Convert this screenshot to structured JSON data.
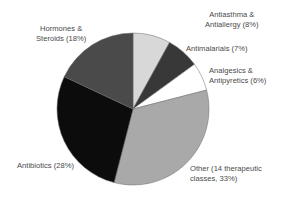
{
  "chart_data": {
    "type": "pie",
    "title": "",
    "start_angle": "12 o'clock",
    "direction": "clockwise",
    "slices": [
      {
        "name": "Antiasthma & Antiallergy",
        "value": 8,
        "color": "#d8d8d8"
      },
      {
        "name": "Antimalarials",
        "value": 7,
        "color": "#383838"
      },
      {
        "name": "Analgesics & Antipyretics",
        "value": 6,
        "color": "#ffffff"
      },
      {
        "name": "Other (14 therapeutic classes)",
        "value": 33,
        "color": "#a9a9a9"
      },
      {
        "name": "Antibiotics",
        "value": 28,
        "color": "#0c0c0c"
      },
      {
        "name": "Hormones & Steroids",
        "value": 18,
        "color": "#4a4a4a"
      }
    ],
    "categories": [
      "Antiasthma & Antiallergy",
      "Antimalarials",
      "Analgesics & Antipyretics",
      "Other (14 therapeutic classes)",
      "Antibiotics",
      "Hormones & Steroids"
    ],
    "values": [
      8,
      7,
      6,
      33,
      28,
      18
    ],
    "unit": "%",
    "legend": "none (direct slice labels)"
  },
  "labels": {
    "antiasthma": {
      "line1": "Antiasthma &",
      "line2": "Antiallergy (8%)"
    },
    "antimalarials": {
      "line1": "Antimalarials (7%)"
    },
    "analgesics": {
      "line1": "Analgesics &",
      "line2": "Antipyretics (6%)"
    },
    "other": {
      "line1": "Other (14 therapeutic",
      "line2": "classes, 33%)"
    },
    "antibiotics": {
      "line1": "Antibiotics (28%)"
    },
    "hormones": {
      "line1": "Hormones &",
      "line2": "Steroids (18%)"
    }
  },
  "geometry": {
    "cx": 133,
    "cy": 109,
    "r": 76
  }
}
